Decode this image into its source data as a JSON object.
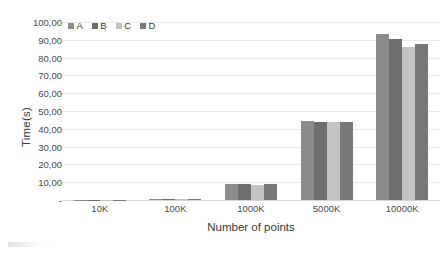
{
  "chart_data": {
    "type": "bar",
    "title": "",
    "xlabel": "Number of points",
    "ylabel": "Time(s)",
    "categories": [
      "10K",
      "100K",
      "1000K",
      "5000K",
      "10000K"
    ],
    "series": [
      {
        "name": "A",
        "color": "#8c8c8c",
        "values": [
          0.1,
          0.55,
          9.0,
          44.2,
          93.0
        ]
      },
      {
        "name": "B",
        "color": "#6e6e6e",
        "values": [
          0.1,
          0.55,
          9.1,
          44.0,
          90.2
        ]
      },
      {
        "name": "C",
        "color": "#c3c3c3",
        "values": [
          0.08,
          0.45,
          8.7,
          43.6,
          85.8
        ]
      },
      {
        "name": "D",
        "color": "#787878",
        "values": [
          0.1,
          0.5,
          8.9,
          43.8,
          87.5
        ]
      }
    ],
    "ylim": [
      0,
      100
    ],
    "ytick_step": 10,
    "ytick_labels": [
      "100,00",
      "90,00",
      "80,00",
      "70,00",
      "60,00",
      "50,00",
      "40,00",
      "30,00",
      "20,00",
      "10,00",
      "-"
    ],
    "ytick_values": [
      100,
      90,
      80,
      70,
      60,
      50,
      40,
      30,
      20,
      10,
      0
    ],
    "grid": true,
    "legend_position": "top-left-inside",
    "decimal_separator": ","
  }
}
